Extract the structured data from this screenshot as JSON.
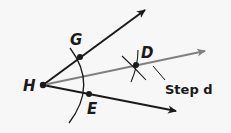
{
  "diagram": {
    "points": [
      {
        "name": "H",
        "label": "H",
        "x": 43,
        "y": 85
      },
      {
        "name": "G",
        "label": "G",
        "x": 80,
        "y": 57
      },
      {
        "name": "E",
        "label": "E",
        "x": 89,
        "y": 94
      },
      {
        "name": "D",
        "label": "D",
        "x": 136,
        "y": 65
      }
    ],
    "rays": [
      {
        "name": "ray-HG",
        "from": "H",
        "to_arrow": [
          145,
          10
        ],
        "color": "#1a1a1a"
      },
      {
        "name": "ray-HE",
        "from": "H",
        "to_arrow": [
          176,
          111
        ],
        "color": "#1a1a1a"
      },
      {
        "name": "ray-HD",
        "from": "H",
        "to_arrow": [
          205,
          51
        ],
        "color": "#808080"
      }
    ],
    "annotation": {
      "text": "Step d"
    },
    "colors": {
      "ink": "#1a1a1a",
      "bisector": "#808080",
      "background": "#f7f7f7"
    }
  }
}
